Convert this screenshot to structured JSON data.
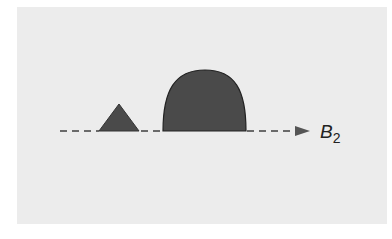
{
  "diagram": {
    "background_color": "#ececec",
    "shape_fill": "#4a4a4a",
    "axis_color": "#6a6a6a",
    "axis": {
      "label_main": "B",
      "label_subscript": "2",
      "style": "dashed",
      "direction": "right"
    },
    "shapes": [
      {
        "type": "triangle",
        "description": "small triangular peak"
      },
      {
        "type": "dome",
        "description": "large rounded dome"
      }
    ]
  }
}
